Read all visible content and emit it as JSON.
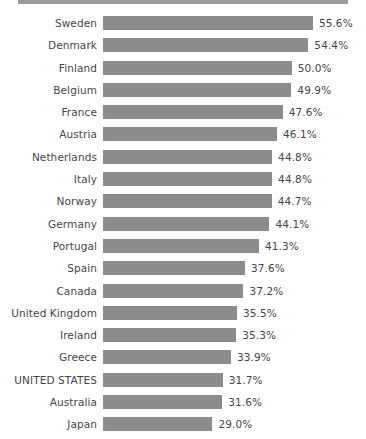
{
  "chart_data": {
    "type": "bar",
    "orientation": "horizontal",
    "title": "",
    "subtitle": "",
    "xlabel": "",
    "ylabel": "",
    "grid": false,
    "legend": null,
    "value_suffix": "%",
    "xlim": [
      0,
      55.6
    ],
    "categories": [
      "Sweden",
      "Denmark",
      "Finland",
      "Belgium",
      "France",
      "Austria",
      "Netherlands",
      "Italy",
      "Norway",
      "Germany",
      "Portugal",
      "Spain",
      "Canada",
      "United Kingdom",
      "Ireland",
      "Greece",
      "UNITED STATES",
      "Australia",
      "Japan"
    ],
    "values": [
      55.6,
      54.4,
      50.0,
      49.9,
      47.6,
      46.1,
      44.8,
      44.8,
      44.7,
      44.1,
      41.3,
      37.6,
      37.2,
      35.5,
      35.3,
      33.9,
      31.7,
      31.6,
      29.0
    ],
    "value_labels": [
      "55.6%",
      "54.4%",
      "50.0%",
      "49.9%",
      "47.6%",
      "46.1%",
      "44.8%",
      "44.8%",
      "44.7%",
      "44.1%",
      "41.3%",
      "37.6%",
      "37.2%",
      "35.5%",
      "35.3%",
      "33.9%",
      "31.7%",
      "31.6%",
      "29.0%"
    ]
  },
  "style": {
    "bar_color": "#8c8c8c",
    "text_color": "#454545",
    "background_color": "#ffffff",
    "top_strip_color": "#9a9a9a"
  },
  "layout": {
    "bar_origin_x_px": 103,
    "px_per_percent": 3.775,
    "row_pitch_px": 22.3,
    "bar_height_px": 14,
    "value_gap_px": 6
  }
}
